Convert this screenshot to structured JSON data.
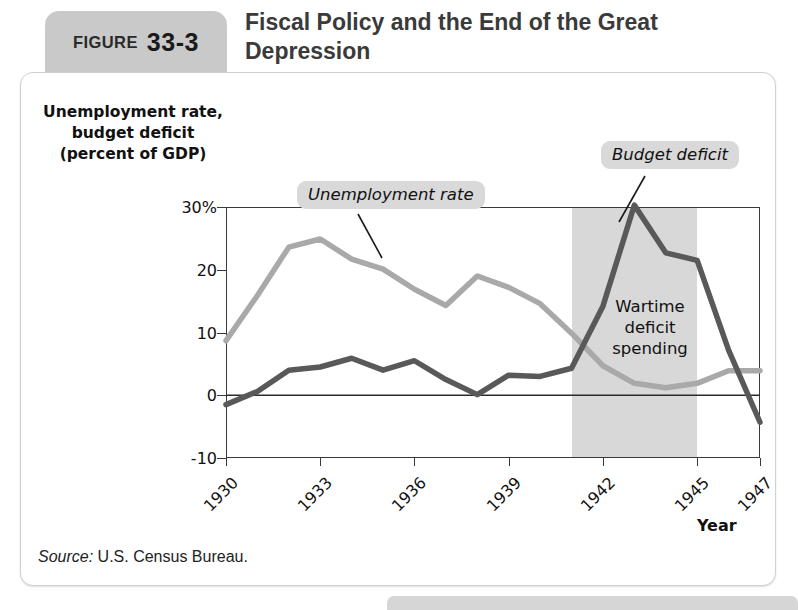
{
  "figure": {
    "tab_word": "FIGURE",
    "number": "33-3",
    "title": "Fiscal Policy and the End of\nthe Great Depression",
    "source_prefix": "Source:",
    "source_text": " U.S. Census Bureau."
  },
  "chart_data": {
    "type": "line",
    "title": "Fiscal Policy and the End of the Great Depression",
    "xlabel": "Year",
    "ylabel": "Unemployment rate,\nbudget deficit\n(percent of GDP)",
    "x": [
      1930,
      1931,
      1932,
      1933,
      1934,
      1935,
      1936,
      1937,
      1938,
      1939,
      1940,
      1941,
      1942,
      1943,
      1944,
      1945,
      1946,
      1947
    ],
    "xlim": [
      1930,
      1947
    ],
    "ylim": [
      -10,
      30
    ],
    "xticks": [
      "1930",
      "1933",
      "1936",
      "1939",
      "1942",
      "1945",
      "1947"
    ],
    "xtick_values": [
      1930,
      1933,
      1936,
      1939,
      1942,
      1945,
      1947
    ],
    "yticks": [
      "30%",
      "20",
      "10",
      "0",
      "-10"
    ],
    "ytick_values": [
      30,
      20,
      10,
      0,
      -10
    ],
    "grid": false,
    "zero_line": true,
    "legend": "annotations",
    "series": [
      {
        "name": "Unemployment rate",
        "color": "#a9a9a9",
        "values": [
          8.7,
          15.9,
          23.6,
          24.9,
          21.7,
          20.1,
          16.9,
          14.3,
          19.0,
          17.2,
          14.6,
          9.9,
          4.7,
          1.9,
          1.2,
          1.9,
          3.9,
          3.9
        ]
      },
      {
        "name": "Budget deficit",
        "color": "#595959",
        "values": [
          -1.5,
          0.6,
          4.0,
          4.5,
          5.9,
          4.0,
          5.5,
          2.5,
          0.1,
          3.2,
          3.0,
          4.3,
          14.2,
          30.3,
          22.7,
          21.5,
          7.2,
          -4.3
        ]
      }
    ],
    "shaded_region": {
      "label": "Wartime\ndeficit\nspending",
      "x_start": 1941,
      "x_end": 1945,
      "color": "#d8d8d8"
    },
    "annotations": [
      {
        "text": "Unemployment rate",
        "series": "Unemployment rate"
      },
      {
        "text": "Budget deficit",
        "series": "Budget deficit"
      }
    ]
  },
  "colors": {
    "unemployment_line": "#a9a9a9",
    "deficit_line": "#595959",
    "band": "#d8d8d8",
    "axis": "#3a3a3a",
    "callout_bg": "#d9d9d9",
    "tab_bg": "#c9c9c9"
  }
}
